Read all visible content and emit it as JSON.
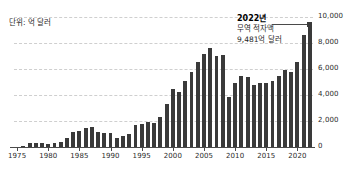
{
  "unit_label": "단위: 억 달러",
  "annotation": {
    "title": "2022년",
    "line1": "무역 적자액",
    "line2": "9,481억 달러"
  },
  "colors": {
    "bar": "#3a3a3a",
    "axis": "#4a4a4a",
    "grid": "#cfcfcf",
    "text": "#1f1f1f",
    "background": "#ffffff"
  },
  "chart_data": {
    "type": "bar",
    "title": "",
    "subtitle": "",
    "xlabel": "",
    "ylabel": "단위: 억 달러",
    "ylim": [
      0,
      10000
    ],
    "yticks": [
      0,
      2000,
      4000,
      6000,
      8000,
      10000
    ],
    "ytick_labels": [
      "0",
      "2,000",
      "4,000",
      "6,000",
      "8,000",
      "10,000"
    ],
    "xticks": [
      1975,
      1980,
      1985,
      1990,
      1995,
      2000,
      2005,
      2010,
      2015,
      2020
    ],
    "xtick_labels": [
      "1975",
      "1980",
      "1985",
      "1990",
      "1995",
      "2000",
      "2005",
      "2010",
      "2015",
      "2020"
    ],
    "grid": true,
    "grid_style": "dashed-horizontal",
    "legend": false,
    "categories": [
      1975,
      1976,
      1977,
      1978,
      1979,
      1980,
      1981,
      1982,
      1983,
      1984,
      1985,
      1986,
      1987,
      1988,
      1989,
      1990,
      1991,
      1992,
      1993,
      1994,
      1995,
      1996,
      1997,
      1998,
      1999,
      2000,
      2001,
      2002,
      2003,
      2004,
      2005,
      2006,
      2007,
      2008,
      2009,
      2010,
      2011,
      2012,
      2013,
      2014,
      2015,
      2016,
      2017,
      2018,
      2019,
      2020,
      2021,
      2022
    ],
    "values": [
      0,
      90,
      310,
      340,
      275,
      255,
      280,
      365,
      675,
      1125,
      1220,
      1450,
      1520,
      1140,
      1090,
      1110,
      665,
      845,
      1000,
      1660,
      1740,
      1910,
      1810,
      2300,
      3285,
      4460,
      4220,
      5070,
      5780,
      6550,
      7140,
      7600,
      7020,
      7080,
      3840,
      4950,
      5480,
      5370,
      4780,
      4900,
      4950,
      5050,
      5500,
      5920,
      5770,
      6530,
      8610,
      9481
    ],
    "highlight_index": 47,
    "highlight_annotation": {
      "year": "2022년",
      "label": "무역 적자액",
      "value": "9,481억 달러"
    }
  }
}
